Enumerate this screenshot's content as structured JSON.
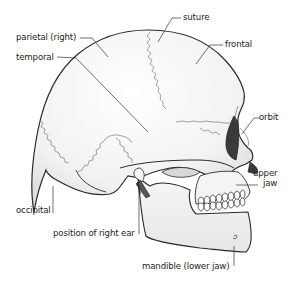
{
  "diagram": {
    "labels": {
      "parietal": "parietal (right)",
      "temporal": "temporal",
      "suture": "suture",
      "frontal": "frontal",
      "orbit": "orbit",
      "upper_jaw_line1": "upper",
      "upper_jaw_line2": "jaw",
      "occipital": "occipital",
      "ear": "position of right ear",
      "mandible": "mandible (lower jaw)"
    },
    "colors": {
      "bone_fill": "#f4f4f4",
      "bone_shadow": "#dcdcdc",
      "outline": "#2a2a2a",
      "suture_line": "#555555",
      "orbit_fill": "#3a3a3a",
      "leader_line": "#333333",
      "text": "#1e1e1e"
    }
  }
}
